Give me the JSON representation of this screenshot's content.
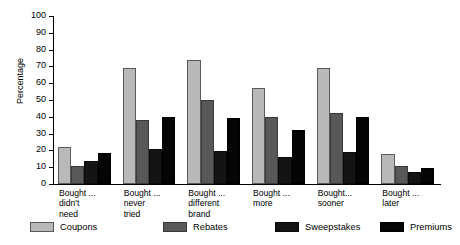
{
  "chart_data": {
    "type": "bar",
    "title": "",
    "xlabel": "",
    "ylabel": "Percentage",
    "ylim": [
      0,
      100
    ],
    "ytick_step": 10,
    "yticks": [
      0,
      10,
      20,
      30,
      40,
      50,
      60,
      70,
      80,
      90,
      100
    ],
    "ytick_labels": [
      "0",
      "10",
      "20",
      "30",
      "40",
      "50",
      "60",
      "70",
      "80",
      "90",
      "100"
    ],
    "grid": false,
    "legend_position": "bottom",
    "categories": [
      "Bought ...\ndidn't\nneed",
      "Bought ...\nnever\ntried",
      "Bought ...\ndifferent\nbrand",
      "Bought ...\nmore",
      "Bought...\nsooner",
      "Bought ...\nlater"
    ],
    "series": [
      {
        "name": "Coupons",
        "color": "#b9b9b9",
        "values": [
          22,
          69,
          74,
          57,
          69,
          18
        ]
      },
      {
        "name": "Rebates",
        "color": "#585858",
        "values": [
          11,
          38,
          50,
          40,
          42,
          11
        ]
      },
      {
        "name": "Sweepstakes",
        "color": "#141414",
        "values": [
          13.5,
          21,
          19.5,
          16,
          19,
          7
        ]
      },
      {
        "name": "Premiums",
        "color": "#050505",
        "values": [
          18.5,
          40,
          39,
          32,
          40,
          9.5
        ]
      }
    ]
  },
  "legend": {
    "items": [
      {
        "label": "Coupons"
      },
      {
        "label": "Rebates"
      },
      {
        "label": "Sweepstakes"
      },
      {
        "label": "Premiums"
      }
    ]
  }
}
